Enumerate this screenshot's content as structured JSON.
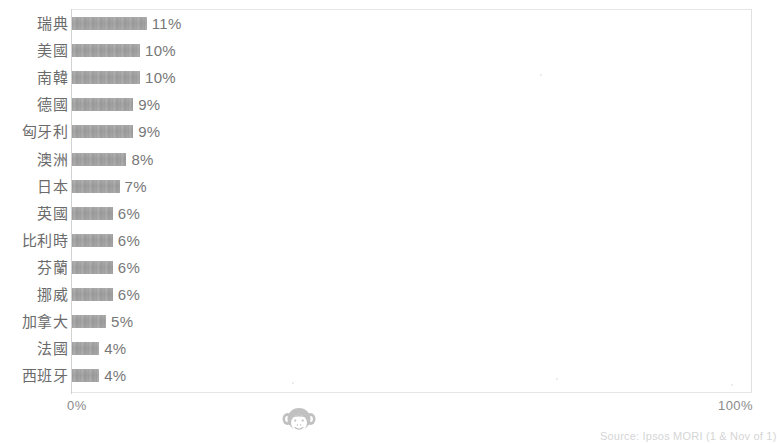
{
  "chart_data": {
    "type": "bar",
    "orientation": "horizontal",
    "title": "",
    "xlabel": "",
    "ylabel": "",
    "xlim": [
      0,
      100
    ],
    "grid": false,
    "legend": null,
    "tick_labels": [
      "0%",
      "100%"
    ],
    "categories": [
      "瑞典",
      "美國",
      "南韓",
      "德國",
      "匈牙利",
      "澳洲",
      "日本",
      "英國",
      "比利時",
      "芬蘭",
      "挪威",
      "加拿大",
      "法國",
      "西班牙"
    ],
    "values": [
      11,
      10,
      10,
      9,
      9,
      8,
      7,
      6,
      6,
      6,
      6,
      5,
      4,
      4
    ],
    "data_labels": [
      "11%",
      "10%",
      "10%",
      "9%",
      "9%",
      "8%",
      "7%",
      "6%",
      "6%",
      "6%",
      "6%",
      "5%",
      "4%",
      "4%"
    ],
    "bar_color": "#8d8d8d",
    "axis_color": "#d2d2d2",
    "frame_color": "#e6e6e6"
  },
  "axis": {
    "left_tick": "0%",
    "right_tick": "100%"
  },
  "watermark": {
    "name": "monkey-face-watermark"
  },
  "footer": {
    "source_text": "Source: Ipsos MORI (1 & Nov of 1)"
  }
}
